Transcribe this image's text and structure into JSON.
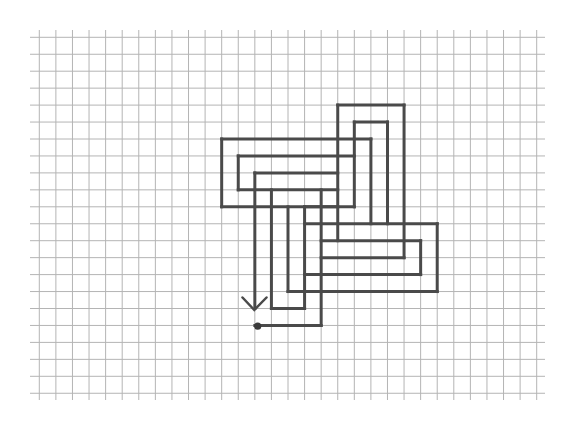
{
  "diagram": {
    "type": "grid-maze-path",
    "colors": {
      "background": "#ffffff",
      "grid": "#b4b4b4",
      "path": "#4a4a4a",
      "dot": "#3a3a3a"
    },
    "grid": {
      "x0": 39.3,
      "dx": 16.58,
      "cols": 31,
      "y0": 37.3,
      "dy": 16.95,
      "rows": 22,
      "h_extent": [
        30,
        545
      ],
      "v_extent": [
        30,
        400
      ]
    },
    "col_offset": 11,
    "row_offset": 4,
    "segments": [
      [
        [
          0,
          2
        ],
        [
          9,
          2
        ]
      ],
      [
        [
          0,
          2
        ],
        [
          0,
          6
        ]
      ],
      [
        [
          0,
          6
        ],
        [
          8,
          6
        ]
      ],
      [
        [
          1,
          3
        ],
        [
          8,
          3
        ]
      ],
      [
        [
          1,
          3
        ],
        [
          1,
          5
        ]
      ],
      [
        [
          1,
          5
        ],
        [
          7,
          5
        ]
      ],
      [
        [
          2,
          4
        ],
        [
          7,
          4
        ]
      ],
      [
        [
          2,
          4
        ],
        [
          2,
          12
        ]
      ],
      [
        [
          3,
          5
        ],
        [
          3,
          12
        ]
      ],
      [
        [
          3,
          12
        ],
        [
          5,
          12
        ]
      ],
      [
        [
          4,
          6
        ],
        [
          4,
          11
        ]
      ],
      [
        [
          4,
          11
        ],
        [
          13,
          11
        ]
      ],
      [
        [
          5,
          6
        ],
        [
          5,
          12
        ]
      ],
      [
        [
          5,
          6
        ],
        [
          7,
          6
        ]
      ],
      [
        [
          6,
          5
        ],
        [
          6,
          13
        ]
      ],
      [
        [
          2,
          13
        ],
        [
          6,
          13
        ]
      ],
      [
        [
          7,
          0
        ],
        [
          7,
          8
        ]
      ],
      [
        [
          7,
          0
        ],
        [
          11,
          0
        ]
      ],
      [
        [
          8,
          1
        ],
        [
          8,
          6
        ]
      ],
      [
        [
          8,
          1
        ],
        [
          10,
          1
        ]
      ],
      [
        [
          9,
          2
        ],
        [
          9,
          7
        ]
      ],
      [
        [
          10,
          1
        ],
        [
          10,
          7
        ]
      ],
      [
        [
          11,
          0
        ],
        [
          11,
          9
        ]
      ],
      [
        [
          5,
          7
        ],
        [
          13,
          7
        ]
      ],
      [
        [
          13,
          7
        ],
        [
          13,
          11
        ]
      ],
      [
        [
          6,
          8
        ],
        [
          12,
          8
        ]
      ],
      [
        [
          12,
          8
        ],
        [
          12,
          10
        ]
      ],
      [
        [
          5,
          10
        ],
        [
          12,
          10
        ]
      ],
      [
        [
          6,
          9
        ],
        [
          11,
          9
        ]
      ]
    ],
    "arrow": {
      "tip": [
        254.3,
        310
      ],
      "left_arm": [
        242.5,
        297.5
      ],
      "right_arm": [
        266.5,
        297.5
      ],
      "direction": "down"
    },
    "start_dot": {
      "cx": 257.7,
      "cy": 326.2,
      "r": 3.6
    }
  }
}
